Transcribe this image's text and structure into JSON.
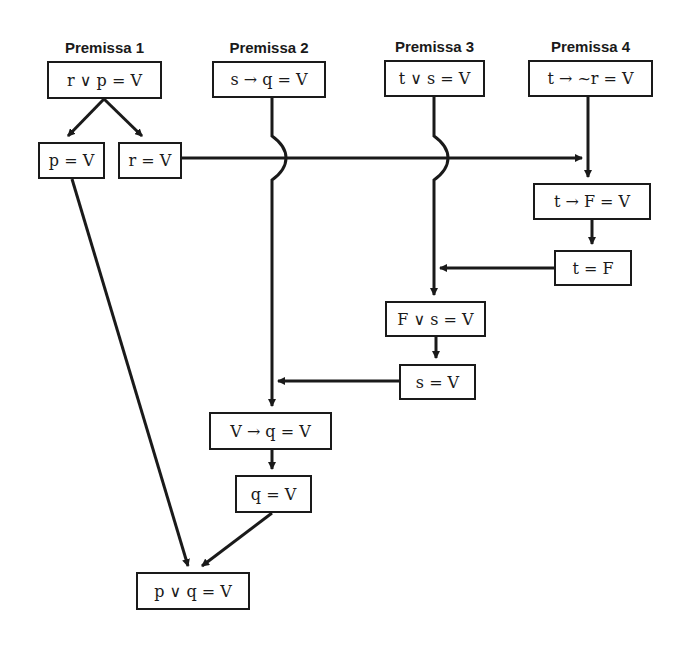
{
  "premises": [
    {
      "title": "Premissa 1",
      "expr": "r ∨ p = V"
    },
    {
      "title": "Premissa 2",
      "expr": "s → q = V"
    },
    {
      "title": "Premissa 3",
      "expr": "t ∨ s = V"
    },
    {
      "title": "Premissa 4",
      "expr": "t → ~r = V"
    }
  ],
  "steps": {
    "p_true": "p = V",
    "r_true": "r = V",
    "t_imp_F": "t → F = V",
    "t_false": "t = F",
    "F_or_s": "F ∨ s = V",
    "s_true": "s = V",
    "V_imp_q": "V → q = V",
    "q_true": "q = V",
    "conclusion": "p ∨ q = V"
  },
  "colors": {
    "line": "#1a1a1a",
    "background": "#ffffff"
  }
}
